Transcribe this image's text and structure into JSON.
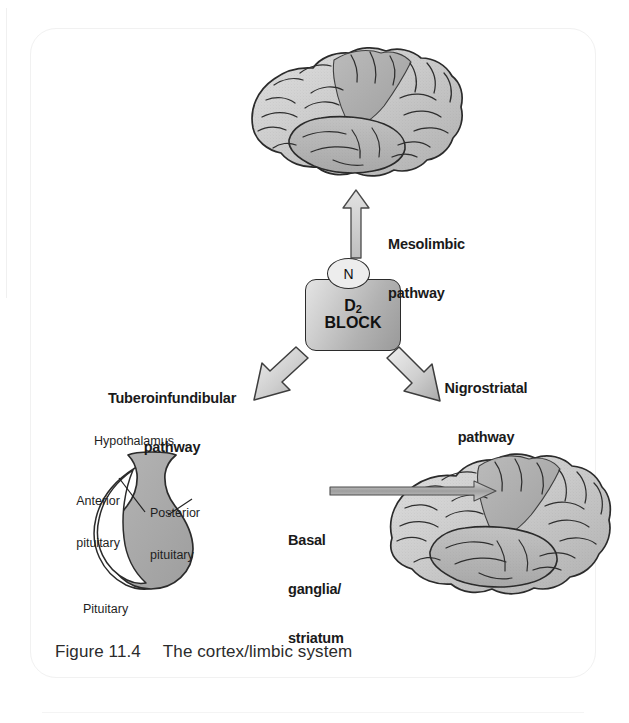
{
  "figure": {
    "caption_number": "Figure 11.4",
    "caption_title": "The cortex/limbic system"
  },
  "central_node": {
    "receptor_label": "N",
    "box_line1_symbol": "D",
    "box_line1_subscript": "2",
    "box_line2": "BLOCK"
  },
  "pathways": [
    {
      "id": "mesolimbic",
      "label_line1": "Mesolimbic",
      "label_line2": "pathway",
      "direction": "up",
      "target": "cortex/limbic brain"
    },
    {
      "id": "tuberoinfundibular",
      "label_line1": "Tuberoinfundibular",
      "label_line2": "pathway",
      "direction": "down-left",
      "target": "pituitary"
    },
    {
      "id": "nigrostriatal",
      "label_line1": "Nigrostriatal",
      "label_line2": "pathway",
      "direction": "down-right",
      "target": "basal ganglia/striatum"
    }
  ],
  "targets": {
    "basal_ganglia": {
      "line1": "Basal",
      "line2": "ganglia/",
      "line3": "striatum"
    }
  },
  "pituitary_diagram": {
    "hypothalamus": "Hypothalamus",
    "anterior_line1": "Anterior",
    "anterior_line2": "pituitary",
    "posterior_line1": "Posterior",
    "posterior_line2": "pituitary",
    "pituitary": "Pituitary"
  },
  "colors": {
    "ink": "#1a1a1a",
    "brain_light": "#d4d4d4",
    "brain_mid": "#bdbdbd",
    "brain_dark": "#9b9b9b",
    "arrow_fill": "#c9c9c9",
    "box_fill": "#bcbcbc",
    "card_border": "#f1f1f1",
    "background": "#ffffff"
  }
}
